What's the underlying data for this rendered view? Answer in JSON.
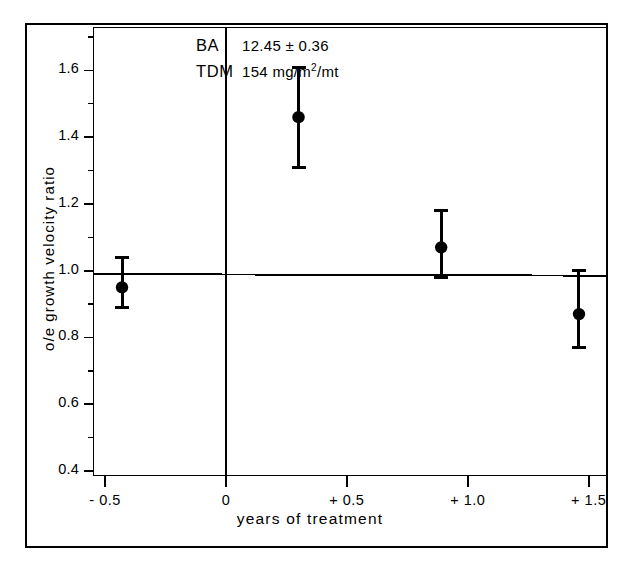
{
  "figure": {
    "annotation": {
      "ba_key": "BA",
      "ba_value": "12.45 ± 0.36",
      "tdm_key": "TDM",
      "tdm_value_pre": "154 mg/m",
      "tdm_value_sup": "2",
      "tdm_value_post": "/mt"
    }
  },
  "chart_data": {
    "type": "scatter",
    "title": "",
    "xlabel": "years of treatment",
    "ylabel": "o/e growth velocity ratio",
    "xlim": [
      -0.55,
      1.58
    ],
    "ylim": [
      0.385,
      1.73
    ],
    "grid": false,
    "legend": null,
    "xticks": [
      -0.5,
      0,
      0.5,
      1.0,
      1.5
    ],
    "xtick_labels": [
      "- 0.5",
      "0",
      "+ 0.5",
      "+ 1.0",
      "+ 1.5"
    ],
    "xminor_ticks": [
      -0.25,
      0.25,
      0.75,
      1.25
    ],
    "yticks": [
      0.4,
      0.6,
      0.8,
      1.0,
      1.2,
      1.4,
      1.6
    ],
    "ytick_labels": [
      "0.4",
      "0.6",
      "0.8",
      "1.0",
      "1.2",
      "1.4",
      "1.6"
    ],
    "yminor_ticks": [
      0.5,
      0.7,
      0.9,
      1.1,
      1.3,
      1.5,
      1.7
    ],
    "series": [
      {
        "name": "o/e growth velocity ratio",
        "marker": "filled-circle",
        "color": "#000000",
        "points": [
          {
            "x": -0.43,
            "y": 0.95,
            "err_low": 0.89,
            "err_high": 1.04
          },
          {
            "x": 0.3,
            "y": 1.46,
            "err_low": 1.31,
            "err_high": 1.61
          },
          {
            "x": 0.89,
            "y": 1.07,
            "err_low": 0.98,
            "err_high": 1.18
          },
          {
            "x": 1.46,
            "y": 0.87,
            "err_low": 0.77,
            "err_high": 1.0
          }
        ]
      }
    ],
    "reference_lines": [
      {
        "name": "regression-line",
        "orientation": "horizontal",
        "y_start": 0.99,
        "y_end": 0.985,
        "x_start": -0.55,
        "x_end": 1.58
      },
      {
        "name": "zero-vertical-line",
        "orientation": "vertical",
        "x": 0.0
      }
    ]
  }
}
